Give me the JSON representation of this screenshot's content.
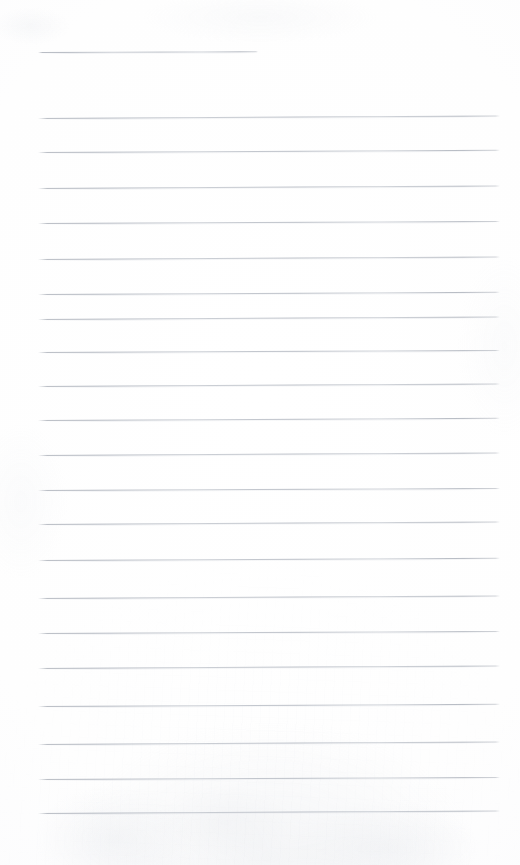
{
  "document": {
    "kind": "lined-notebook-page",
    "title": "Blank lined notebook page",
    "description": "Scanned blank ruled writing paper with no handwriting or printed text",
    "page_width": 520,
    "page_height": 865,
    "background_color": "#fefefe",
    "rule_color": "#b0b5be",
    "rule_thickness_px": 1,
    "text_content": "",
    "handwriting_present": false
  },
  "layout": {
    "left_margin_x": 38,
    "right_margin_x": 500,
    "top_blank_height": 52,
    "bottom_blank_height": 52,
    "rule_spacing_px": 36,
    "total_rule_count": 22,
    "header_rule_count": 1,
    "body_rule_count": 21
  },
  "rules": [
    {
      "index": 1,
      "y": 52,
      "x_start": 38,
      "x_end": 258,
      "role": "header-rule",
      "tilt_deg": -0.22
    },
    {
      "index": 2,
      "y": 118,
      "x_start": 38,
      "x_end": 500,
      "role": "body-rule",
      "tilt_deg": -0.3
    },
    {
      "index": 3,
      "y": 152,
      "x_start": 38,
      "x_end": 500,
      "role": "body-rule",
      "tilt_deg": -0.28
    },
    {
      "index": 4,
      "y": 188,
      "x_start": 38,
      "x_end": 500,
      "role": "body-rule",
      "tilt_deg": -0.3
    },
    {
      "index": 5,
      "y": 223,
      "x_start": 38,
      "x_end": 500,
      "role": "body-rule",
      "tilt_deg": -0.26
    },
    {
      "index": 6,
      "y": 259,
      "x_start": 38,
      "x_end": 500,
      "role": "body-rule",
      "tilt_deg": -0.3
    },
    {
      "index": 7,
      "y": 294,
      "x_start": 38,
      "x_end": 500,
      "role": "body-rule",
      "tilt_deg": -0.28
    },
    {
      "index": 8,
      "y": 319,
      "x_start": 38,
      "x_end": 500,
      "role": "body-rule",
      "tilt_deg": -0.3
    },
    {
      "index": 9,
      "y": 352,
      "x_start": 38,
      "x_end": 500,
      "role": "body-rule",
      "tilt_deg": -0.26
    },
    {
      "index": 10,
      "y": 386,
      "x_start": 38,
      "x_end": 500,
      "role": "body-rule",
      "tilt_deg": -0.3
    },
    {
      "index": 11,
      "y": 420,
      "x_start": 38,
      "x_end": 500,
      "role": "body-rule",
      "tilt_deg": -0.28
    },
    {
      "index": 12,
      "y": 455,
      "x_start": 38,
      "x_end": 500,
      "role": "body-rule",
      "tilt_deg": -0.3
    },
    {
      "index": 13,
      "y": 490,
      "x_start": 38,
      "x_end": 500,
      "role": "body-rule",
      "tilt_deg": -0.26
    },
    {
      "index": 14,
      "y": 524,
      "x_start": 38,
      "x_end": 500,
      "role": "body-rule",
      "tilt_deg": -0.3
    },
    {
      "index": 15,
      "y": 560,
      "x_start": 38,
      "x_end": 500,
      "role": "body-rule",
      "tilt_deg": -0.28
    },
    {
      "index": 16,
      "y": 598,
      "x_start": 38,
      "x_end": 500,
      "role": "body-rule",
      "tilt_deg": -0.3
    },
    {
      "index": 17,
      "y": 633,
      "x_start": 38,
      "x_end": 500,
      "role": "body-rule",
      "tilt_deg": -0.26
    },
    {
      "index": 18,
      "y": 668,
      "x_start": 38,
      "x_end": 500,
      "role": "body-rule",
      "tilt_deg": -0.3
    },
    {
      "index": 19,
      "y": 706,
      "x_start": 38,
      "x_end": 500,
      "role": "body-rule",
      "tilt_deg": -0.28
    },
    {
      "index": 20,
      "y": 744,
      "x_start": 38,
      "x_end": 500,
      "role": "body-rule",
      "tilt_deg": -0.3
    },
    {
      "index": 21,
      "y": 779,
      "x_start": 38,
      "x_end": 500,
      "role": "body-rule",
      "tilt_deg": -0.26
    },
    {
      "index": 22,
      "y": 813,
      "x_start": 38,
      "x_end": 500,
      "role": "body-rule",
      "tilt_deg": -0.3
    }
  ]
}
